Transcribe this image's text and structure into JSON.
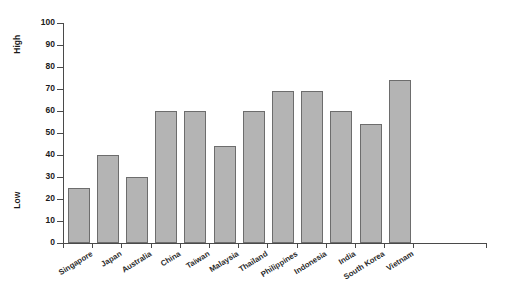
{
  "chart_data": {
    "type": "bar",
    "title": "",
    "subtitle": "",
    "xlabel": "",
    "ylabel": "",
    "ylim": [
      0,
      100
    ],
    "ytick_step": 10,
    "yticks": [
      0,
      10,
      20,
      30,
      40,
      50,
      60,
      70,
      80,
      90,
      100
    ],
    "grid": false,
    "legend": null,
    "axis_annotations": {
      "high": "High",
      "low": "Low"
    },
    "bar_color": "#b4b4b4",
    "bar_border_color": "#6d6d6d",
    "axis_color": "#4a4a4a",
    "categories": [
      "Singapore",
      "Japan",
      "Australia",
      "China",
      "Taiwan",
      "Malaysia",
      "Thailand",
      "Philippines",
      "Indonesia",
      "India",
      "South Korea",
      "Vietnam"
    ],
    "values": [
      25,
      40,
      30,
      60,
      60,
      44,
      60,
      69,
      69,
      60,
      54,
      74
    ]
  }
}
